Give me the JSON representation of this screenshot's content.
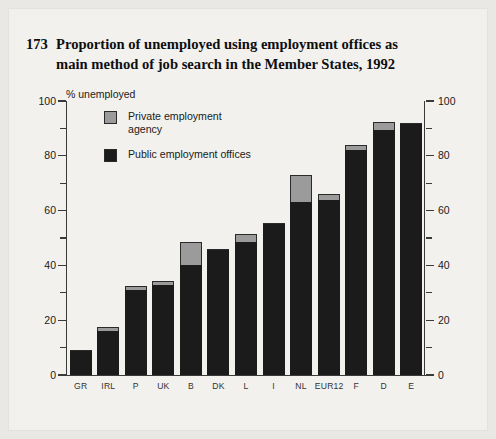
{
  "figure": {
    "number": "173",
    "title_line1": "Proportion of unemployed using employment offices as",
    "title_line2": "main method of job search in the Member States, 1992",
    "axis_unit_label": "% unemployed"
  },
  "legend": {
    "items": [
      {
        "key": "private",
        "label": "Private employment agency",
        "color": "#9b9b9b"
      },
      {
        "key": "public",
        "label": "Public employment offices",
        "color": "#1b1b1b"
      }
    ]
  },
  "axis": {
    "left_ticks": [
      "100",
      "80",
      "60",
      "40",
      "20",
      "0"
    ],
    "right_ticks": [
      "100",
      "80",
      "60",
      "40",
      "20",
      "0"
    ]
  },
  "chart_data": {
    "type": "bar",
    "stacked": true,
    "xlabel": "",
    "ylabel": "% unemployed",
    "ylim": [
      0,
      100
    ],
    "ytick_step": 20,
    "minor_tick_step": 10,
    "grid": false,
    "legend_position": "upper-left-inside",
    "categories": [
      "GR",
      "IRL",
      "P",
      "UK",
      "B",
      "DK",
      "L",
      "I",
      "NL",
      "EUR12",
      "F",
      "D",
      "E"
    ],
    "series": [
      {
        "name": "Public employment offices",
        "color": "#1b1b1b",
        "values": [
          9,
          16,
          31,
          33,
          40,
          46,
          48.5,
          55.5,
          63,
          64,
          82,
          89.5,
          92
        ]
      },
      {
        "name": "Private employment agency",
        "color": "#9b9b9b",
        "values": [
          0,
          1,
          1,
          1,
          8,
          0,
          2.5,
          0,
          9.5,
          1.5,
          1.5,
          2.5,
          0
        ]
      }
    ],
    "totals": [
      9,
      17,
      32,
      34,
      48,
      46,
      51,
      55.5,
      72.5,
      65.5,
      83.5,
      92,
      92
    ]
  }
}
